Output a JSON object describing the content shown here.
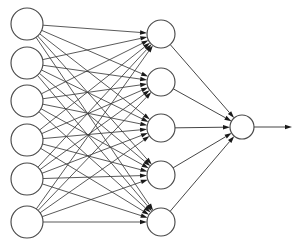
{
  "diagram": {
    "type": "neural-network-diagram",
    "canvas": {
      "width": 304,
      "height": 250,
      "background": "#ffffff"
    },
    "style": {
      "node_fill": "#ffffff",
      "node_stroke": "#4a4a4a",
      "node_stroke_width": 1.15,
      "edge_stroke": "#3c3c3c",
      "edge_stroke_width": 0.85,
      "arrowhead_fill": "#1a1a1a",
      "arrowhead_length": 7,
      "arrowhead_width": 4.4
    },
    "layers": [
      {
        "name": "input-layer",
        "role": "input",
        "count": 6,
        "radius": 16,
        "x": 27,
        "nodes": [
          {
            "id": "i1",
            "cx": 27,
            "cy": 24
          },
          {
            "id": "i2",
            "cx": 27,
            "cy": 63
          },
          {
            "id": "i3",
            "cx": 27,
            "cy": 101
          },
          {
            "id": "i4",
            "cx": 27,
            "cy": 140
          },
          {
            "id": "i5",
            "cx": 27,
            "cy": 179
          },
          {
            "id": "i6",
            "cx": 27,
            "cy": 222
          }
        ]
      },
      {
        "name": "hidden-layer",
        "role": "hidden",
        "count": 5,
        "radius": 14,
        "x": 161,
        "nodes": [
          {
            "id": "h1",
            "cx": 161,
            "cy": 34
          },
          {
            "id": "h2",
            "cx": 161,
            "cy": 82
          },
          {
            "id": "h3",
            "cx": 161,
            "cy": 128
          },
          {
            "id": "h4",
            "cx": 161,
            "cy": 175
          },
          {
            "id": "h5",
            "cx": 161,
            "cy": 222
          }
        ]
      },
      {
        "name": "output-layer",
        "role": "output",
        "count": 1,
        "radius": 12,
        "x": 242,
        "nodes": [
          {
            "id": "o1",
            "cx": 242,
            "cy": 127
          }
        ]
      }
    ],
    "connections": [
      {
        "group": "input-to-hidden",
        "from_layer": "input-layer",
        "to_layer": "hidden-layer",
        "fully_connected": true,
        "edge_count": 30,
        "arrowheads": true
      },
      {
        "group": "hidden-to-output",
        "from_layer": "hidden-layer",
        "to_layer": "output-layer",
        "fully_connected": true,
        "edge_count": 5,
        "arrowheads": true
      }
    ],
    "output_arrow": {
      "name": "network-output-arrow",
      "x1": 254,
      "y1": 127,
      "x2": 292,
      "y2": 127,
      "arrowhead": true
    }
  }
}
